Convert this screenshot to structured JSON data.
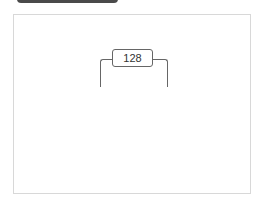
{
  "header": {
    "bar_color": "#4a4a4a"
  },
  "diagram": {
    "bracket_label": "128"
  }
}
